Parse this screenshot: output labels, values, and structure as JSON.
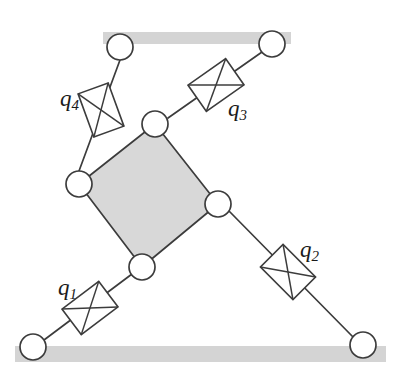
{
  "figure": {
    "background_color": "#ffffff",
    "line_color": "#3c3c3c",
    "platform_fill": "#d8d8d8",
    "ground_fill": "#d4d4d4",
    "joint_fill": "#ffffff"
  },
  "ground_bars": [
    {
      "name": "top-ground-bar",
      "x": 103,
      "y": 32,
      "width": 188,
      "height": 12,
      "color": "#d4d4d4"
    },
    {
      "name": "bottom-ground-bar",
      "x": 15,
      "y": 346,
      "width": 371,
      "height": 16,
      "color": "#d4d4d4"
    }
  ],
  "platform": {
    "name": "moving-platform",
    "fill": "#d8d8d8",
    "stroke": "#3c3c3c",
    "vertices": [
      {
        "name": "platform-vertex-top",
        "x": 155,
        "y": 124
      },
      {
        "name": "platform-vertex-right",
        "x": 218,
        "y": 204
      },
      {
        "name": "platform-vertex-bottom",
        "x": 142,
        "y": 267
      },
      {
        "name": "platform-vertex-left",
        "x": 79,
        "y": 184
      }
    ]
  },
  "joints": [
    {
      "id": "J-top-left-base",
      "name": "base-joint-top-left",
      "x": 120,
      "y": 47,
      "r": 13
    },
    {
      "id": "J-top-right-base",
      "name": "base-joint-top-right",
      "x": 272,
      "y": 44,
      "r": 13
    },
    {
      "id": "J-bottom-left-base",
      "name": "base-joint-bottom-left",
      "x": 33,
      "y": 347,
      "r": 13
    },
    {
      "id": "J-bottom-right-base",
      "name": "base-joint-bottom-right",
      "x": 363,
      "y": 345,
      "r": 13
    },
    {
      "id": "J-platform-top",
      "name": "platform-joint-top",
      "x": 155,
      "y": 124,
      "r": 13
    },
    {
      "id": "J-platform-right",
      "name": "platform-joint-right",
      "x": 218,
      "y": 204,
      "r": 13
    },
    {
      "id": "J-platform-bottom",
      "name": "platform-joint-bottom",
      "x": 142,
      "y": 267,
      "r": 13
    },
    {
      "id": "J-platform-left",
      "name": "platform-joint-left",
      "x": 79,
      "y": 184,
      "r": 13
    }
  ],
  "links": [
    {
      "name": "link-q4",
      "from": "J-top-left-base",
      "to": "J-platform-left",
      "x1": 120,
      "y1": 60,
      "x2": 79,
      "y2": 171
    },
    {
      "name": "link-q3",
      "from": "J-top-right-base",
      "to": "J-platform-top",
      "x1": 262,
      "y1": 52,
      "x2": 168,
      "y2": 118
    },
    {
      "name": "link-q1",
      "from": "J-bottom-left-base",
      "to": "J-platform-bottom",
      "x1": 44,
      "y1": 340,
      "x2": 132,
      "y2": 274
    },
    {
      "name": "link-q2",
      "from": "J-platform-right",
      "to": "J-bottom-right-base",
      "x1": 229,
      "y1": 211,
      "x2": 354,
      "y2": 338
    }
  ],
  "actuators": [
    {
      "id": "q1",
      "name": "prismatic-actuator-q1",
      "cx": 90,
      "cy": 308,
      "angle": -37,
      "width": 46,
      "height": 32,
      "label": "q",
      "subscript": "1",
      "label_x": 58,
      "label_y": 295
    },
    {
      "id": "q2",
      "name": "prismatic-actuator-q2",
      "cx": 288,
      "cy": 272,
      "angle": 45,
      "width": 46,
      "height": 32,
      "label": "q",
      "subscript": "2",
      "label_x": 300,
      "label_y": 257
    },
    {
      "id": "q3",
      "name": "prismatic-actuator-q3",
      "cx": 216,
      "cy": 85,
      "angle": -35,
      "width": 46,
      "height": 32,
      "label": "q",
      "subscript": "3",
      "label_x": 228,
      "label_y": 116
    },
    {
      "id": "q4",
      "name": "prismatic-actuator-q4",
      "cx": 101,
      "cy": 110,
      "angle": 70,
      "width": 46,
      "height": 32,
      "label": "q",
      "subscript": "4",
      "label_x": 60,
      "label_y": 106
    }
  ],
  "chart_data": {
    "type": "diagram",
    "labels": [
      "q1",
      "q2",
      "q3",
      "q4"
    ],
    "joint_count": 8,
    "link_count": 4,
    "ground_rail_count": 2
  }
}
